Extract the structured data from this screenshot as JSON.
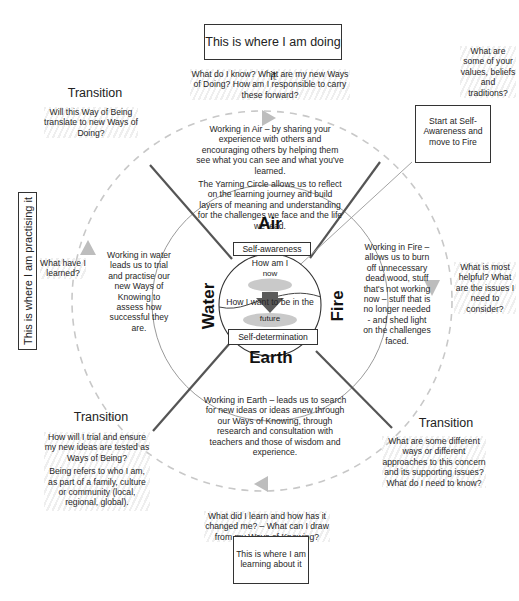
{
  "top_box": {
    "label": "This is where I am doing it"
  },
  "bottom_box": {
    "label": "This is where I am learning about it"
  },
  "left_box": {
    "label": "This is where I am practising it"
  },
  "start_box": {
    "label": "Start at Self-Awareness and move to Fire"
  },
  "top_question": "What do I know? What are my new Ways of Doing? How am I responsible to carry these forward?",
  "top_right_question": "What are some of your values, beliefs and traditions?",
  "right_question": "What is most helpful? What are the issues I need to consider?",
  "left_question": "What have I learned?",
  "bottom_question": "What did I learn and how has it changed me? – What can I draw from my Ways of Knowing?",
  "transitions": {
    "top_left": {
      "title": "Transition",
      "text": "Will this Way of Being translate to new Ways of Doing?"
    },
    "bottom_left": {
      "title": "Transition",
      "text1": "How will I trial and ensure my new ideas are tested as Ways of Being?",
      "text2": "Being refers to who I am, as part of a family, culture or community (local, regional, global)."
    },
    "bottom_right": {
      "title": "Transition",
      "text": "What are some different ways or different approaches to this concern and its supporting issues? What do I need to know?"
    }
  },
  "quadrants": {
    "air": {
      "text1": "Working in Air – by sharing your experience with others and encouraging others by helping them see what you can see and what you've learned.",
      "text2": "The Yarning Circle allows us to reflect on the learning journey and build layers of meaning and understanding for the challenges we face and the life we lead."
    },
    "water": {
      "text": "Working in water leads us to trial and practise our new Ways of Knowing to assess how successful they are."
    },
    "fire": {
      "text": "Working in Fire – allows us to burn off unnecessary dead wood, stuff that's not working now – stuff that is no longer needed - and shed light on the challenges faced."
    },
    "earth": {
      "text": "Working in Earth – leads us to search for new ideas or ideas anew through our Ways of Knowing, through research and consultation with teachers and those of wisdom and experience."
    }
  },
  "elements": {
    "air": "Air",
    "water": "Water",
    "fire": "Fire",
    "earth": "Earth"
  },
  "inner": {
    "self_awareness": "Self-awareness",
    "self_determination": "Self-determination",
    "how_am_i": "How am I",
    "now": "now",
    "how_i_want": "How I want to be in the",
    "future": "future"
  },
  "colors": {
    "line": "#555555",
    "dashed": "#c8c8c8",
    "arrow": "#666666",
    "arrow_light": "#bdbdbd",
    "ellipse": "#c9c9c9"
  }
}
